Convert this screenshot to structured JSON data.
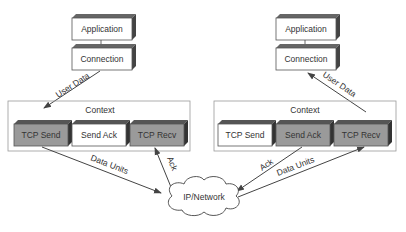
{
  "left": {
    "application": "Application",
    "connection": "Connection",
    "context": "Context",
    "tcp_send": "TCP Send",
    "send_ack": "Send Ack",
    "tcp_recv": "TCP Recv",
    "user_data": "User Data",
    "data_units": "Data Units",
    "ack": "Ack"
  },
  "right": {
    "application": "Application",
    "connection": "Connection",
    "context": "Context",
    "tcp_send": "TCP Send",
    "send_ack": "Send Ack",
    "tcp_recv": "TCP Recv",
    "user_data": "User Data",
    "data_units": "Data Units",
    "ack": "Ack"
  },
  "network": "IP/Network",
  "colors": {
    "active_box": "#9a9a9a",
    "inactive_box": "#ffffff",
    "box_side": "#555555",
    "line": "#444444"
  }
}
